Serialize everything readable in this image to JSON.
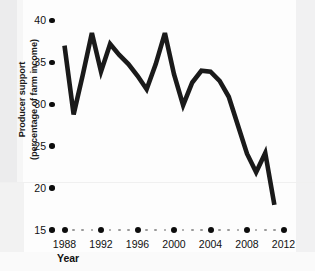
{
  "chart_data": {
    "type": "line",
    "title": "",
    "xlabel": "Year",
    "ylabel": "Producer support (percentage of farm income)",
    "ylabel_line1": "Producer support",
    "ylabel_line2": "(percentage of farm income)",
    "xlim": [
      1988,
      2012
    ],
    "ylim": [
      15,
      40
    ],
    "grid": false,
    "legend": "none",
    "y_ticks": [
      40,
      35,
      30,
      25,
      20,
      15
    ],
    "y_tick_labels": [
      "40",
      "35",
      "30",
      "25",
      "20",
      "15"
    ],
    "x_ticks": [
      1988,
      1992,
      1996,
      2000,
      2004,
      2008,
      2012
    ],
    "x_tick_labels": [
      "1988",
      "1992",
      "1996",
      "2000",
      "2004",
      "2008",
      "2012"
    ],
    "x_minor_ticks": [
      1989,
      1990,
      1991,
      1993,
      1994,
      1995,
      1997,
      1998,
      1999,
      2001,
      2002,
      2003,
      2005,
      2006,
      2007,
      2009,
      2010,
      2011
    ],
    "series": [
      {
        "name": "Producer support",
        "color": "#1a1a1a",
        "x": [
          1988,
          1989,
          1990,
          1991,
          1992,
          1993,
          1994,
          1995,
          1996,
          1997,
          1998,
          1999,
          2000,
          2001,
          2002,
          2003,
          2004,
          2005,
          2006,
          2007,
          2008,
          2009,
          2010,
          2011
        ],
        "values": [
          37.0,
          28.8,
          33.5,
          38.5,
          33.9,
          37.2,
          35.9,
          34.8,
          33.4,
          31.8,
          34.8,
          38.5,
          33.6,
          29.9,
          32.6,
          34.0,
          33.9,
          32.8,
          30.9,
          27.5,
          24.1,
          21.9,
          24.2,
          18.0
        ]
      }
    ]
  },
  "axes": {
    "y_label_line1": "Producer support",
    "y_label_line2": "(percentage of farm income)",
    "x_label": "Year"
  }
}
